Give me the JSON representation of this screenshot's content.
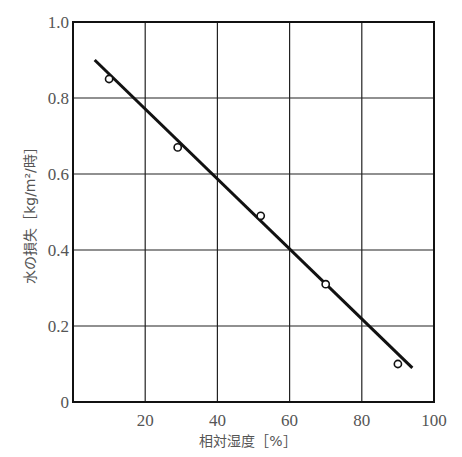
{
  "chart_data": {
    "type": "scatter",
    "title": "",
    "xlabel": "相対湿度［%］",
    "ylabel": "水の損失［kg/m²/時］",
    "xlim": [
      0,
      100
    ],
    "ylim": [
      0,
      1.0
    ],
    "x_ticks": [
      20,
      40,
      60,
      80,
      100
    ],
    "x_tick_labels": [
      "20",
      "40",
      "60",
      "80",
      "100"
    ],
    "y_ticks": [
      0,
      0.2,
      0.4,
      0.6,
      0.8,
      1.0
    ],
    "y_tick_labels": [
      "0",
      "0.2",
      "0.4",
      "0.6",
      "0.8",
      "1.0"
    ],
    "grid": true,
    "legend": null,
    "series": [
      {
        "name": "measured",
        "marker": "open-circle",
        "x": [
          10,
          29,
          52,
          70,
          90
        ],
        "y": [
          0.85,
          0.67,
          0.49,
          0.31,
          0.1
        ]
      },
      {
        "name": "fit-line",
        "style": "line",
        "x": [
          6,
          94
        ],
        "y": [
          0.9,
          0.09
        ]
      }
    ]
  },
  "layout": {
    "plot_left": 73,
    "plot_top": 22,
    "plot_right": 434,
    "plot_bottom": 402
  }
}
